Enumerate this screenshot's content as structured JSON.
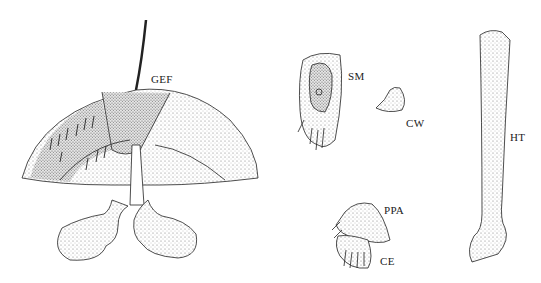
{
  "labels": {
    "gef": "GEF",
    "sm": "SM",
    "cw": "CW",
    "ht": "HT",
    "ppa": "PPA",
    "ce": "CE"
  },
  "colors": {
    "ink": "#222222",
    "stipple": "#cfcfcf",
    "paper": "#ffffff"
  }
}
